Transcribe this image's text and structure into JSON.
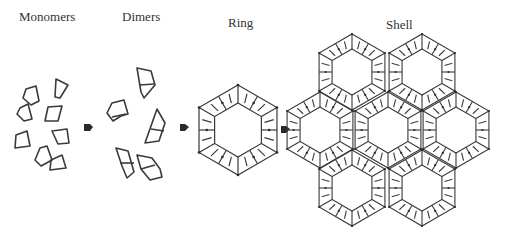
{
  "stages": [
    {
      "label": "Monomers"
    },
    {
      "label": "Dimers"
    },
    {
      "label": "Ring"
    },
    {
      "label": "Shell"
    }
  ],
  "arrows": [
    {
      "from": "Monomers",
      "to": "Dimers",
      "icon": "arrow-right-icon"
    },
    {
      "from": "Dimers",
      "to": "Ring",
      "icon": "arrow-right-icon"
    },
    {
      "from": "Ring",
      "to": "Shell",
      "icon": "arrow-right-icon"
    }
  ],
  "colors": {
    "stroke": "#3a3a3a",
    "background": "#ffffff",
    "text": "#333333"
  }
}
